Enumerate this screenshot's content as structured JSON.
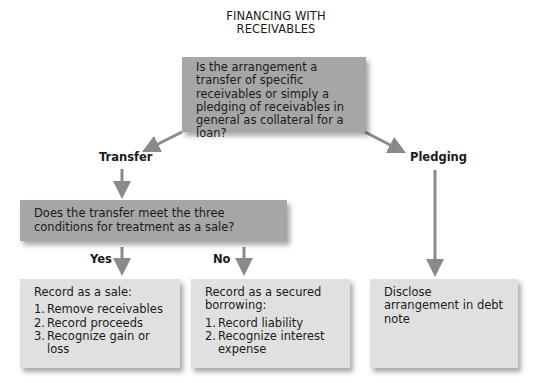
{
  "title": "FINANCING WITH RECEIVABLES",
  "top_question": "Is the arrangement a transfer of specific receivables or simply a pledging of receivables in general as collateral for a loan?",
  "branches": {
    "left": "Transfer",
    "right": "Pledging"
  },
  "transfer_question": "Does the transfer meet the three conditions for treatment as a sale?",
  "answers": {
    "yes": "Yes",
    "no": "No"
  },
  "outcomes": {
    "sale": {
      "heading": "Record as a sale:",
      "steps": [
        {
          "num": "1.",
          "text": "Remove receivables"
        },
        {
          "num": "2.",
          "text": "Record proceeds"
        },
        {
          "num": "3.",
          "text": "Recognize gain or loss"
        }
      ]
    },
    "secured_borrowing": {
      "heading": "Record as a secured borrowing:",
      "steps": [
        {
          "num": "1.",
          "text": "Record liability"
        },
        {
          "num": "2.",
          "text": "Recognize interest expense"
        }
      ]
    },
    "pledging": {
      "heading": "Disclose arrangement in debt note"
    }
  },
  "colors": {
    "question_box": "#a6a6a6",
    "result_box": "#e0e0e0",
    "arrow": "#8a8a8a"
  }
}
